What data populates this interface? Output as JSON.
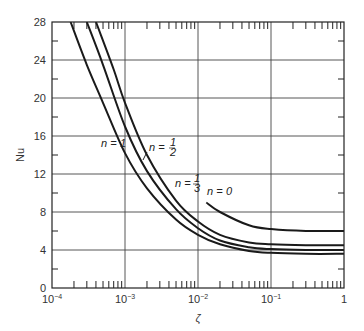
{
  "chart_data": {
    "type": "line",
    "title": "",
    "xlabel": "ζ",
    "ylabel": "Nu",
    "xscale": "log",
    "xlim": [
      0.0001,
      1
    ],
    "ylim": [
      0,
      28
    ],
    "grid": true,
    "x_ticks": [
      "10^-4",
      "10^-3",
      "10^-2",
      "10^-1",
      "1"
    ],
    "y_ticks": [
      "0",
      "4",
      "8",
      "12",
      "16",
      "20",
      "24",
      "28"
    ],
    "legend": "inline curve labels",
    "series": [
      {
        "name": "n = 1",
        "x": [
          0.00018,
          0.0003,
          0.0005,
          0.001,
          0.002,
          0.005,
          0.01,
          0.02,
          0.05,
          0.1,
          0.3,
          1
        ],
        "y": [
          28,
          23.5,
          19.5,
          14.2,
          10.5,
          7.2,
          5.6,
          4.6,
          3.9,
          3.7,
          3.6,
          3.6
        ]
      },
      {
        "name": "n = 1/2",
        "x": [
          0.0003,
          0.0005,
          0.001,
          0.002,
          0.005,
          0.01,
          0.02,
          0.05,
          0.1,
          0.3,
          1
        ],
        "y": [
          28,
          23.5,
          17.0,
          12.3,
          8.3,
          6.3,
          5.0,
          4.3,
          4.1,
          4.0,
          4.0
        ]
      },
      {
        "name": "n = 1/3",
        "x": [
          0.0004,
          0.0007,
          0.001,
          0.002,
          0.005,
          0.01,
          0.02,
          0.05,
          0.1,
          0.3,
          1
        ],
        "y": [
          28,
          23.0,
          19.5,
          14.0,
          9.2,
          7.0,
          5.6,
          4.8,
          4.6,
          4.5,
          4.5
        ]
      },
      {
        "name": "n = 0",
        "x": [
          0.013,
          0.02,
          0.05,
          0.1,
          0.3,
          1
        ],
        "y": [
          9.0,
          8.0,
          6.6,
          6.2,
          6.0,
          6.0
        ]
      }
    ],
    "annotations": [
      {
        "text": "n = 1",
        "frac": "1"
      },
      {
        "text": "n = 1/2",
        "frac": "1/2"
      },
      {
        "text": "n = 1/3",
        "frac": "1/3"
      },
      {
        "text": "n = 0",
        "frac": "0"
      }
    ]
  },
  "labels": {
    "xlabel": "ζ",
    "ylabel": "Nu",
    "n_eq": "n =",
    "n1_val": "1",
    "n_half_num": "1",
    "n_half_den": "2",
    "n_third_num": "1",
    "n_third_den": "3",
    "n0_val": "0",
    "y_ticks": [
      "0",
      "4",
      "8",
      "12",
      "16",
      "20",
      "24",
      "28"
    ],
    "x_tick_base": "10",
    "x_tick_exps": [
      "−4",
      "−3",
      "−2",
      "−1"
    ],
    "x_tick_last": "1"
  }
}
